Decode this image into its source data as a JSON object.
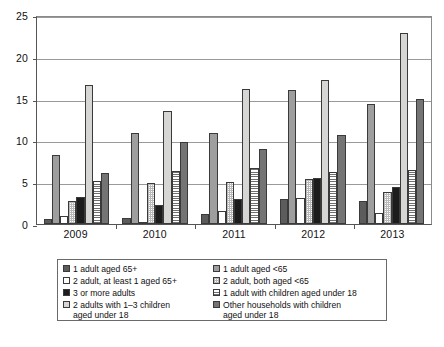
{
  "chart_data": {
    "type": "bar",
    "title": "",
    "xlabel": "",
    "ylabel": "",
    "ylim": [
      0,
      25
    ],
    "yticks": [
      0,
      5,
      10,
      15,
      20,
      25
    ],
    "grid": true,
    "legend_position": "bottom",
    "categories": [
      "2009",
      "2010",
      "2011",
      "2012",
      "2013"
    ],
    "series": [
      {
        "name": "1 adult aged 65+",
        "values": [
          0.6,
          0.7,
          1.2,
          3.0,
          2.8
        ]
      },
      {
        "name": "1 adult aged <65",
        "values": [
          8.2,
          10.9,
          10.9,
          16.0,
          14.4
        ]
      },
      {
        "name": "2 adult, at least 1 aged 65+",
        "values": [
          0.9,
          0.3,
          1.5,
          3.1,
          1.3
        ]
      },
      {
        "name": "2 adult, both aged <65",
        "values": [
          2.7,
          4.9,
          5.0,
          5.4,
          3.8
        ]
      },
      {
        "name": "3 or more adults",
        "values": [
          3.2,
          2.3,
          3.0,
          5.5,
          4.4
        ]
      },
      {
        "name": "1 adult with children aged under 18",
        "values": [
          16.6,
          13.5,
          16.2,
          17.2,
          22.9
        ]
      },
      {
        "name": "2 adults with 1–3 children aged under 18",
        "values": [
          5.2,
          6.3,
          6.7,
          6.2,
          6.5
        ]
      },
      {
        "name": "Other households with children aged under 18",
        "values": [
          6.1,
          9.8,
          9.0,
          10.6,
          14.9
        ]
      }
    ]
  },
  "legend": {
    "left_column": [
      {
        "label": "1 adult aged 65+"
      },
      {
        "label": "2 adult, at least 1 aged 65+"
      },
      {
        "label": "3 or more adults"
      },
      {
        "label": "2 adults with 1–3 children\naged under 18"
      }
    ],
    "right_column": [
      {
        "label": "1 adult aged <65"
      },
      {
        "label": "2 adult, both aged <65"
      },
      {
        "label": "1 adult with children aged under 18"
      },
      {
        "label": "Other households with children\naged under 18"
      }
    ]
  },
  "caption": {
    "text": ""
  }
}
